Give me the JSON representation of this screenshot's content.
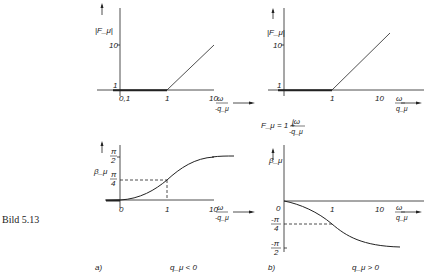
{
  "figure_label": "Bild 5.13",
  "formula": {
    "lhs": "F_μ = 1 + ",
    "num": "jω",
    "den": "-q_μ"
  },
  "panels": {
    "a": {
      "label": "a)",
      "condition": "q_μ < 0",
      "magnitude": {
        "ylabel": "|F_μ|",
        "yticks": [
          "1",
          "10"
        ],
        "xticks": [
          "0,1",
          "1",
          "10"
        ],
        "xlabel_num": "ω",
        "xlabel_den": "-q_μ"
      },
      "phase": {
        "ylabel": "β_μ",
        "yticks_num": [
          "π",
          "π"
        ],
        "yticks_den": [
          "2",
          "4"
        ],
        "xticks": [
          "0",
          "1",
          "10"
        ],
        "xlabel_num": "ω",
        "xlabel_den": "-q_μ"
      }
    },
    "b": {
      "label": "b)",
      "condition": "q_μ > 0",
      "magnitude": {
        "ylabel": "|F_μ|",
        "yticks": [
          "1",
          "10"
        ],
        "xticks": [
          "1",
          "10"
        ],
        "xlabel_num": "ω",
        "xlabel_den": "q_μ"
      },
      "phase": {
        "ylabel": "β_μ",
        "yticks_num": [
          "-π",
          "-π"
        ],
        "yticks_den": [
          "4",
          "2"
        ],
        "xticks": [
          "0",
          "1",
          "10"
        ],
        "xlabel_num": "ω",
        "xlabel_den": "q_μ"
      }
    }
  },
  "colors": {
    "ink": "#222222",
    "background": "#ffffff"
  }
}
